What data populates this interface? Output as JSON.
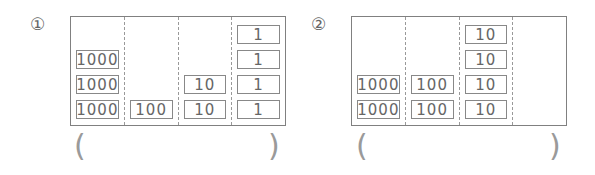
{
  "problems": [
    {
      "label": "①",
      "columns": [
        {
          "place": "thousands",
          "cards": [
            "1000",
            "1000",
            "1000"
          ]
        },
        {
          "place": "hundreds",
          "cards": [
            "100"
          ]
        },
        {
          "place": "tens",
          "cards": [
            "10",
            "10"
          ]
        },
        {
          "place": "ones",
          "cards": [
            "1",
            "1",
            "1",
            "1"
          ]
        }
      ],
      "answer_open": "(",
      "answer_value": "",
      "answer_close": ")"
    },
    {
      "label": "②",
      "columns": [
        {
          "place": "thousands",
          "cards": [
            "1000",
            "1000"
          ]
        },
        {
          "place": "hundreds",
          "cards": [
            "100",
            "100"
          ]
        },
        {
          "place": "tens",
          "cards": [
            "10",
            "10",
            "10",
            "10"
          ]
        },
        {
          "place": "ones",
          "cards": []
        }
      ],
      "answer_open": "(",
      "answer_value": "",
      "answer_close": ")"
    }
  ]
}
